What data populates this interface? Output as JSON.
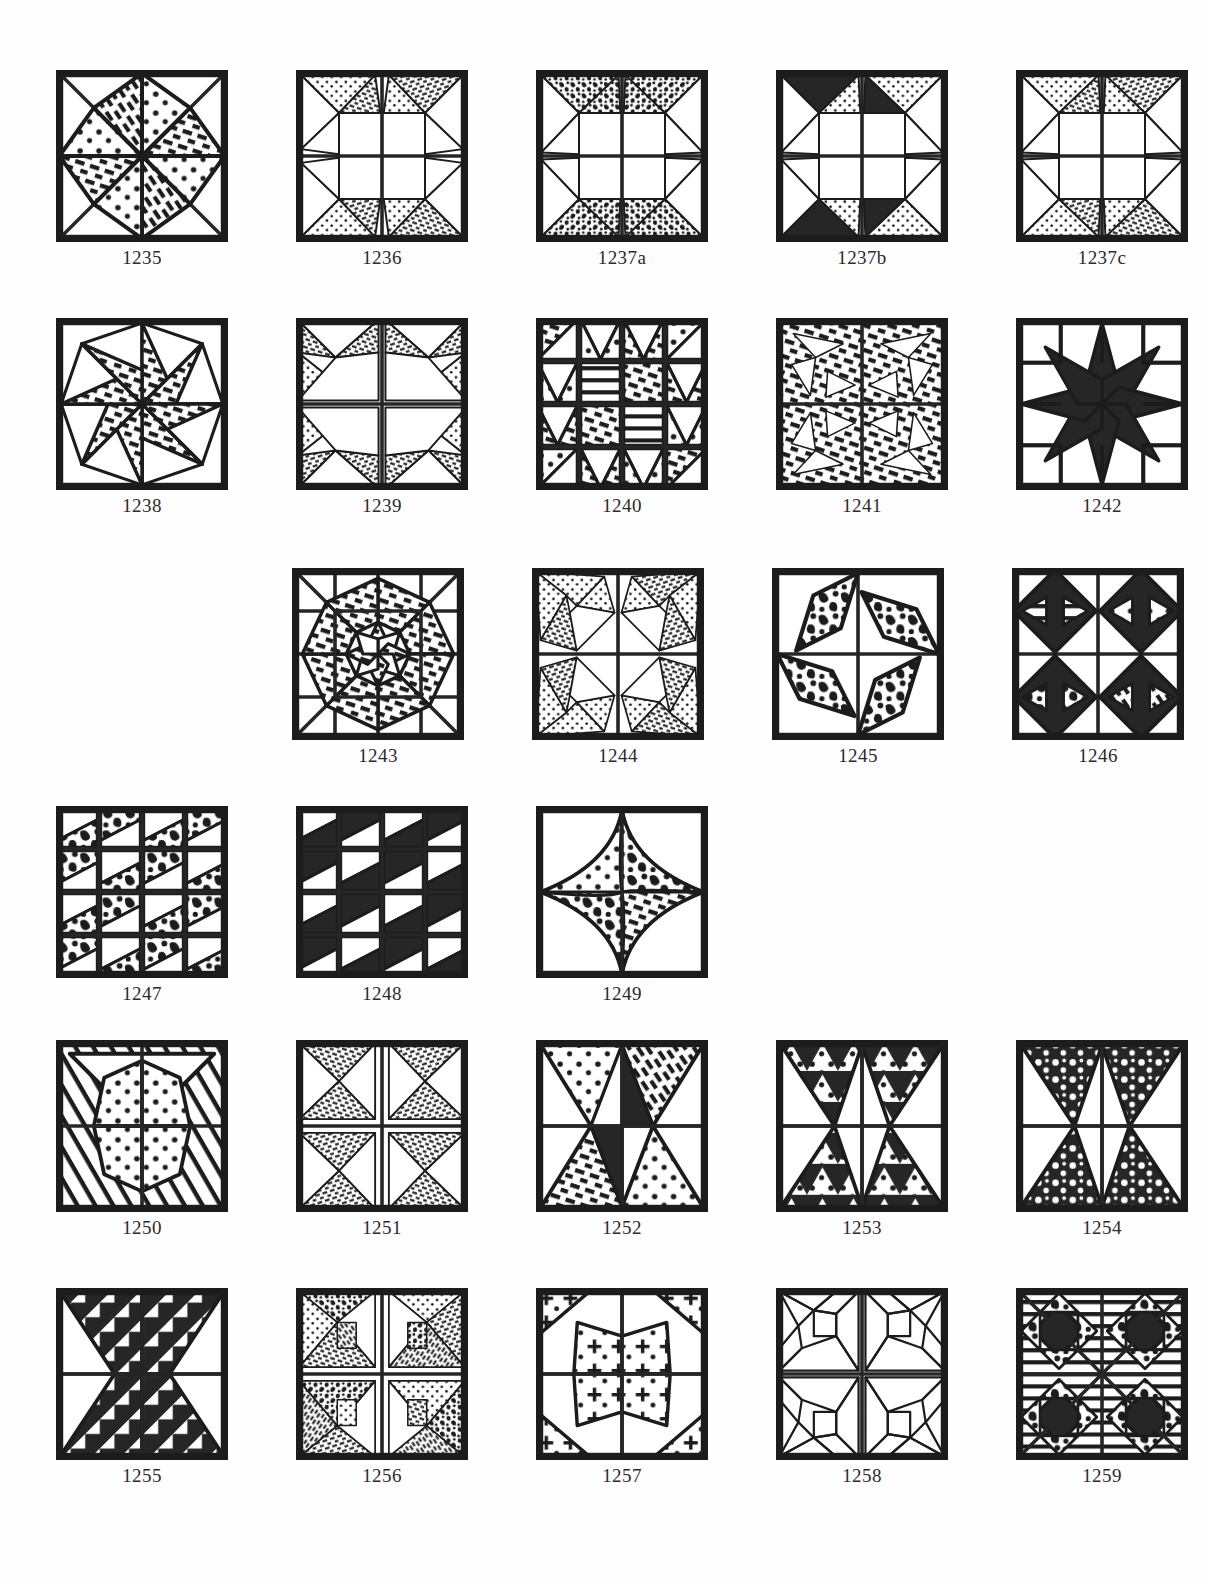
{
  "page": {
    "kind": "quilt-block-pattern-catalog",
    "background_color": "#ffffff",
    "ink_color": "#1c1c1c",
    "caption_color": "#2b2b2b"
  },
  "rows": [
    {
      "row_label": "row-1",
      "blocks": [
        {
          "id": "1235",
          "caption": "1235",
          "size": 172,
          "design": "eight-point-star-diag-square",
          "fills": [
            "dots",
            "hatch",
            "dots",
            "hatch",
            "dots",
            "hatch",
            "dots",
            "hatch"
          ],
          "grid": "quarters-and-diagonals"
        },
        {
          "id": "1236",
          "caption": "1236",
          "size": 172,
          "design": "pinwheel-star-four-patch",
          "fills": [
            "dots",
            "hatch"
          ],
          "grid": "quarters"
        },
        {
          "id": "1237a",
          "caption": "1237a",
          "size": 172,
          "design": "pinwheel-star-four-patch-sharp",
          "fills": [
            "mottled"
          ],
          "grid": "quarters"
        },
        {
          "id": "1237b",
          "caption": "1237b",
          "size": 172,
          "design": "pinwheel-star-four-patch-sharp",
          "fills": [
            "solid",
            "dots",
            "hatch"
          ],
          "grid": "quarters"
        },
        {
          "id": "1237c",
          "caption": "1237c",
          "size": 172,
          "design": "pinwheel-star-four-patch-sharp",
          "fills": [
            "dots",
            "hatch"
          ],
          "grid": "quarters"
        }
      ]
    },
    {
      "row_label": "row-2",
      "blocks": [
        {
          "id": "1238",
          "caption": "1238",
          "size": 172,
          "design": "swirl-eight-point-star",
          "fills": [
            "hatch"
          ],
          "grid": "quarters"
        },
        {
          "id": "1239",
          "caption": "1239",
          "size": 172,
          "design": "four-patch-broken-star",
          "fills": [
            "dots",
            "hatch"
          ],
          "grid": "quarters"
        },
        {
          "id": "1240",
          "caption": "1240",
          "size": 172,
          "design": "nine-patch-sawtooth-star",
          "fills": [
            "dots",
            "hatch"
          ],
          "grid": "four-by-four"
        },
        {
          "id": "1241",
          "caption": "1241",
          "size": 172,
          "design": "dense-hatched-pinwheel",
          "fills": [
            "hatch"
          ],
          "grid": "quarters"
        },
        {
          "id": "1242",
          "caption": "1242",
          "size": 172,
          "design": "lemoyne-eight-point-solid-star",
          "fills": [
            "solid"
          ],
          "grid": "four-by-four"
        }
      ]
    },
    {
      "row_label": "row-3",
      "blocks": [
        {
          "id": "1243",
          "caption": "1243",
          "size": 172,
          "design": "double-ring-hatched-star",
          "fills": [
            "hatch"
          ],
          "grid": "four-by-four-and-diagonals"
        },
        {
          "id": "1244",
          "caption": "1244",
          "size": 172,
          "design": "swirling-dotted-star",
          "fills": [
            "dots",
            "hatch"
          ],
          "grid": "quarters"
        },
        {
          "id": "1245",
          "caption": "1245",
          "size": 172,
          "design": "four-diamond-ring",
          "fills": [
            "mottled",
            "solid"
          ],
          "grid": "quarters"
        },
        {
          "id": "1246",
          "caption": "1246",
          "size": 172,
          "design": "four-solid-hourglass-diamonds",
          "fills": [
            "solid",
            "dots",
            "hatch"
          ],
          "grid": "quarters"
        }
      ]
    },
    {
      "row_label": "row-4",
      "blocks": [
        {
          "id": "1247",
          "caption": "1247",
          "size": 172,
          "design": "sixteen-patch-pinwheel-mottled",
          "fills": [
            "mottled"
          ],
          "grid": "four-by-four"
        },
        {
          "id": "1248",
          "caption": "1248",
          "size": 172,
          "design": "sixteen-patch-pinwheel-solid",
          "fills": [
            "solid"
          ],
          "grid": "four-by-four"
        },
        {
          "id": "1249",
          "caption": "1249",
          "size": 172,
          "design": "concave-four-point-star",
          "fills": [
            "hatch",
            "dots",
            "mottled"
          ],
          "grid": "none"
        }
      ]
    },
    {
      "row_label": "row-5",
      "blocks": [
        {
          "id": "1250",
          "caption": "1250",
          "size": 172,
          "design": "striped-pinwheel-hourglass",
          "fills": [
            "stripes",
            "dots"
          ],
          "grid": "quarters"
        },
        {
          "id": "1251",
          "caption": "1251",
          "size": 172,
          "design": "four-patch-hatched-pinwheel",
          "fills": [
            "hatch"
          ],
          "grid": "quarters"
        },
        {
          "id": "1252",
          "caption": "1252",
          "size": 172,
          "design": "four-point-star-center-pinwheel",
          "fills": [
            "dots",
            "hatch",
            "solid"
          ],
          "grid": "quarters"
        },
        {
          "id": "1253",
          "caption": "1253",
          "size": 172,
          "design": "four-point-star-sawtooth",
          "fills": [
            "solid",
            "dots"
          ],
          "grid": "quarters"
        },
        {
          "id": "1254",
          "caption": "1254",
          "size": 172,
          "design": "four-point-star-speckled",
          "fills": [
            "mottled"
          ],
          "grid": "quarters"
        }
      ]
    },
    {
      "row_label": "row-6",
      "blocks": [
        {
          "id": "1255",
          "caption": "1255",
          "size": 172,
          "design": "four-point-star-feathered",
          "fills": [
            "solid"
          ],
          "grid": "quarters"
        },
        {
          "id": "1256",
          "caption": "1256",
          "size": 172,
          "design": "four-patch-pinwheel-mixed",
          "fills": [
            "dots",
            "hatch",
            "mottled"
          ],
          "grid": "quarters"
        },
        {
          "id": "1257",
          "caption": "1257",
          "size": 172,
          "design": "whirling-kite-star",
          "fills": [
            "crosses"
          ],
          "grid": "quarters"
        },
        {
          "id": "1258",
          "caption": "1258",
          "size": 172,
          "design": "outline-four-patch-star",
          "fills": [
            "none"
          ],
          "grid": "quarters"
        },
        {
          "id": "1259",
          "caption": "1259",
          "size": 172,
          "design": "diamond-grid-striped",
          "fills": [
            "stripes",
            "solid"
          ],
          "grid": "quarters-and-diagonals"
        }
      ]
    }
  ],
  "layout": {
    "rows_top": [
      70,
      318,
      568,
      806,
      1040,
      1288
    ],
    "rows_left": [
      56,
      56,
      292,
      56,
      56,
      56
    ],
    "column_gap": 68
  }
}
